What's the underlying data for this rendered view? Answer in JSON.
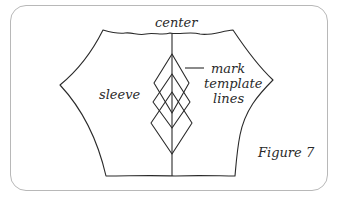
{
  "figure": {
    "caption": "Figure 7",
    "labels": {
      "center": "center",
      "sleeve": "sleeve",
      "mark_line1": "mark",
      "mark_line2": "template",
      "mark_line3": "lines"
    }
  },
  "colors": {
    "line": "#2a2a2a",
    "frame": "#b8b8b8",
    "background": "#ffffff"
  }
}
